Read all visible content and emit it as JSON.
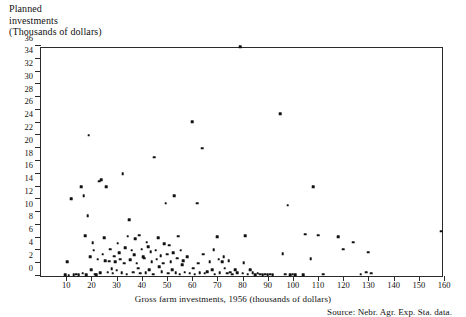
{
  "header": {
    "line1": "Planned",
    "line2": "investments",
    "line3": "(Thousands of dollars)"
  },
  "xcaption": "Gross farm investments, 1956 (thousands of dollars)",
  "source": "Source: Nebr. Agr. Exp. Sta. data.",
  "colors": {
    "ink": "#111111",
    "axis": "#2b2b2b",
    "background": "#ffffff"
  },
  "chart_data": {
    "type": "scatter",
    "title": "",
    "xlabel": "Gross farm investments, 1956 (thousands of dollars)",
    "ylabel": "Planned investments (Thousands of dollars)",
    "xlim": [
      0,
      160
    ],
    "ylim": [
      0,
      36
    ],
    "xticks": [
      10,
      20,
      30,
      40,
      50,
      60,
      70,
      80,
      90,
      100,
      110,
      120,
      130,
      140,
      150,
      160
    ],
    "yticks": [
      0,
      2,
      4,
      6,
      8,
      10,
      12,
      14,
      16,
      18,
      20,
      22,
      24,
      26,
      28,
      30,
      32,
      34,
      36
    ],
    "grid": false,
    "legend": null,
    "marker": "filled-square",
    "n_points": 152,
    "points": [
      [
        9.5,
        0.2
      ],
      [
        10.5,
        2.2
      ],
      [
        11,
        0.1
      ],
      [
        12,
        12.1
      ],
      [
        13,
        0.2
      ],
      [
        14,
        0.3
      ],
      [
        15,
        0.2
      ],
      [
        16,
        14.0
      ],
      [
        16.5,
        0.4
      ],
      [
        17,
        12.6
      ],
      [
        17.5,
        6.3
      ],
      [
        18,
        0.2
      ],
      [
        18.5,
        9.4
      ],
      [
        19,
        22.0
      ],
      [
        19.5,
        3.0
      ],
      [
        20,
        1.0
      ],
      [
        20.5,
        5.2
      ],
      [
        21,
        4.0
      ],
      [
        21.5,
        0.3
      ],
      [
        22,
        0.2
      ],
      [
        22.5,
        2.6
      ],
      [
        23,
        14.8
      ],
      [
        23.5,
        0.5
      ],
      [
        24,
        15.1
      ],
      [
        24.5,
        3.4
      ],
      [
        25,
        6.0
      ],
      [
        25.5,
        2.4
      ],
      [
        26,
        14.0
      ],
      [
        26.5,
        0.6
      ],
      [
        27,
        2.3
      ],
      [
        27.5,
        4.2
      ],
      [
        28,
        1.1
      ],
      [
        28.5,
        0.4
      ],
      [
        29,
        3.1
      ],
      [
        29.5,
        2.2
      ],
      [
        30,
        0.9
      ],
      [
        30.5,
        5.1
      ],
      [
        31,
        3.6
      ],
      [
        31.5,
        2.6
      ],
      [
        32,
        0.5
      ],
      [
        32.5,
        16.0
      ],
      [
        33,
        2.0
      ],
      [
        33.5,
        4.4
      ],
      [
        34,
        0.3
      ],
      [
        34.5,
        6.2
      ],
      [
        35,
        8.8
      ],
      [
        35.5,
        2.5
      ],
      [
        36,
        4.0
      ],
      [
        36.5,
        0.6
      ],
      [
        37,
        3.3
      ],
      [
        37.5,
        5.8
      ],
      [
        38,
        2.0
      ],
      [
        38.5,
        1.2
      ],
      [
        39,
        6.4
      ],
      [
        39.5,
        0.4
      ],
      [
        40,
        4.2
      ],
      [
        40.5,
        3.0
      ],
      [
        41,
        2.8
      ],
      [
        41.5,
        0.5
      ],
      [
        42,
        5.3
      ],
      [
        42.5,
        4.6
      ],
      [
        43,
        1.0
      ],
      [
        43.5,
        3.8
      ],
      [
        44,
        2.2
      ],
      [
        44.5,
        0.3
      ],
      [
        45,
        18.6
      ],
      [
        45.5,
        4.0
      ],
      [
        46,
        2.6
      ],
      [
        46.5,
        6.0
      ],
      [
        47,
        1.4
      ],
      [
        47.5,
        3.2
      ],
      [
        48,
        0.7
      ],
      [
        48.5,
        2.0
      ],
      [
        49,
        5.0
      ],
      [
        49.5,
        11.4
      ],
      [
        50,
        3.4
      ],
      [
        50.5,
        0.4
      ],
      [
        51,
        4.8
      ],
      [
        51.5,
        2.2
      ],
      [
        52,
        1.0
      ],
      [
        52.5,
        3.6
      ],
      [
        53,
        12.6
      ],
      [
        53.5,
        0.5
      ],
      [
        54,
        2.8
      ],
      [
        54.5,
        6.2
      ],
      [
        55,
        0.3
      ],
      [
        55.5,
        4.0
      ],
      [
        56,
        1.8
      ],
      [
        56.5,
        2.4
      ],
      [
        57,
        0.6
      ],
      [
        58,
        3.0
      ],
      [
        59,
        0.4
      ],
      [
        60,
        24.1
      ],
      [
        60.5,
        1.2
      ],
      [
        61,
        0.3
      ],
      [
        62,
        11.4
      ],
      [
        62.5,
        2.0
      ],
      [
        63,
        0.5
      ],
      [
        64,
        20.0
      ],
      [
        64.5,
        3.4
      ],
      [
        65,
        0.4
      ],
      [
        66,
        0.7
      ],
      [
        67,
        2.2
      ],
      [
        68,
        1.0
      ],
      [
        68.5,
        4.1
      ],
      [
        69,
        0.3
      ],
      [
        70,
        6.1
      ],
      [
        70.5,
        2.6
      ],
      [
        71,
        0.5
      ],
      [
        72,
        2.2
      ],
      [
        72.5,
        3.0
      ],
      [
        73,
        1.2
      ],
      [
        74,
        0.4
      ],
      [
        74.5,
        2.4
      ],
      [
        75,
        0.6
      ],
      [
        76,
        0.3
      ],
      [
        77,
        1.0
      ],
      [
        78,
        0.5
      ],
      [
        79,
        35.9
      ],
      [
        80,
        0.4
      ],
      [
        80.5,
        2.1
      ],
      [
        81,
        6.3
      ],
      [
        82,
        0.3
      ],
      [
        83,
        1.0
      ],
      [
        84,
        0.5
      ],
      [
        85,
        0.2
      ],
      [
        86,
        0.4
      ],
      [
        87,
        0.3
      ],
      [
        88,
        0.2
      ],
      [
        89,
        0.3
      ],
      [
        90,
        0.2
      ],
      [
        91,
        0.3
      ],
      [
        92,
        0.2
      ],
      [
        95,
        25.4
      ],
      [
        96,
        3.5
      ],
      [
        97,
        0.3
      ],
      [
        98,
        11.1
      ],
      [
        99,
        0.2
      ],
      [
        100,
        0.3
      ],
      [
        101,
        0.2
      ],
      [
        104,
        0.2
      ],
      [
        105,
        6.5
      ],
      [
        107,
        2.7
      ],
      [
        108,
        14.0
      ],
      [
        110,
        6.4
      ],
      [
        112,
        0.3
      ],
      [
        118,
        6.1
      ],
      [
        120,
        4.2
      ],
      [
        124,
        5.3
      ],
      [
        127,
        0.3
      ],
      [
        129,
        0.6
      ],
      [
        130,
        3.7
      ],
      [
        131,
        0.4
      ],
      [
        159,
        7.0
      ]
    ]
  }
}
